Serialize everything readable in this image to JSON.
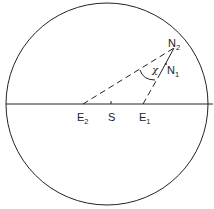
{
  "diagram": {
    "type": "geometric-diagram",
    "labels": {
      "E2": {
        "main": "E",
        "sub": "2"
      },
      "S": {
        "main": "S"
      },
      "E1": {
        "main": "E",
        "sub": "1"
      },
      "N2": {
        "main": "N",
        "sub": "2"
      },
      "N1": {
        "main": "N",
        "sub": "1"
      },
      "chi": "χ"
    },
    "colors": {
      "stroke": "#222222",
      "background": "#ffffff"
    }
  }
}
